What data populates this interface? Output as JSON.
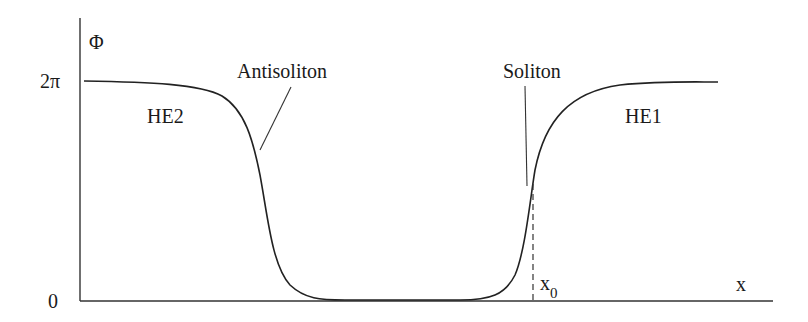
{
  "figure": {
    "y_axis_label": "Φ",
    "x_axis_label": "x",
    "y_ticks": [
      {
        "label": "2π",
        "value": "2π"
      },
      {
        "label": "0",
        "value": "0"
      }
    ],
    "regions": [
      {
        "label": "HE2",
        "side": "left"
      },
      {
        "label": "HE1",
        "side": "right"
      }
    ],
    "annotations": {
      "antisoliton": "Antisoliton",
      "soliton": "Soliton",
      "x0_main": "x",
      "x0_sub": "0"
    },
    "colors": {
      "line": "#222222",
      "background": "#ffffff"
    }
  }
}
